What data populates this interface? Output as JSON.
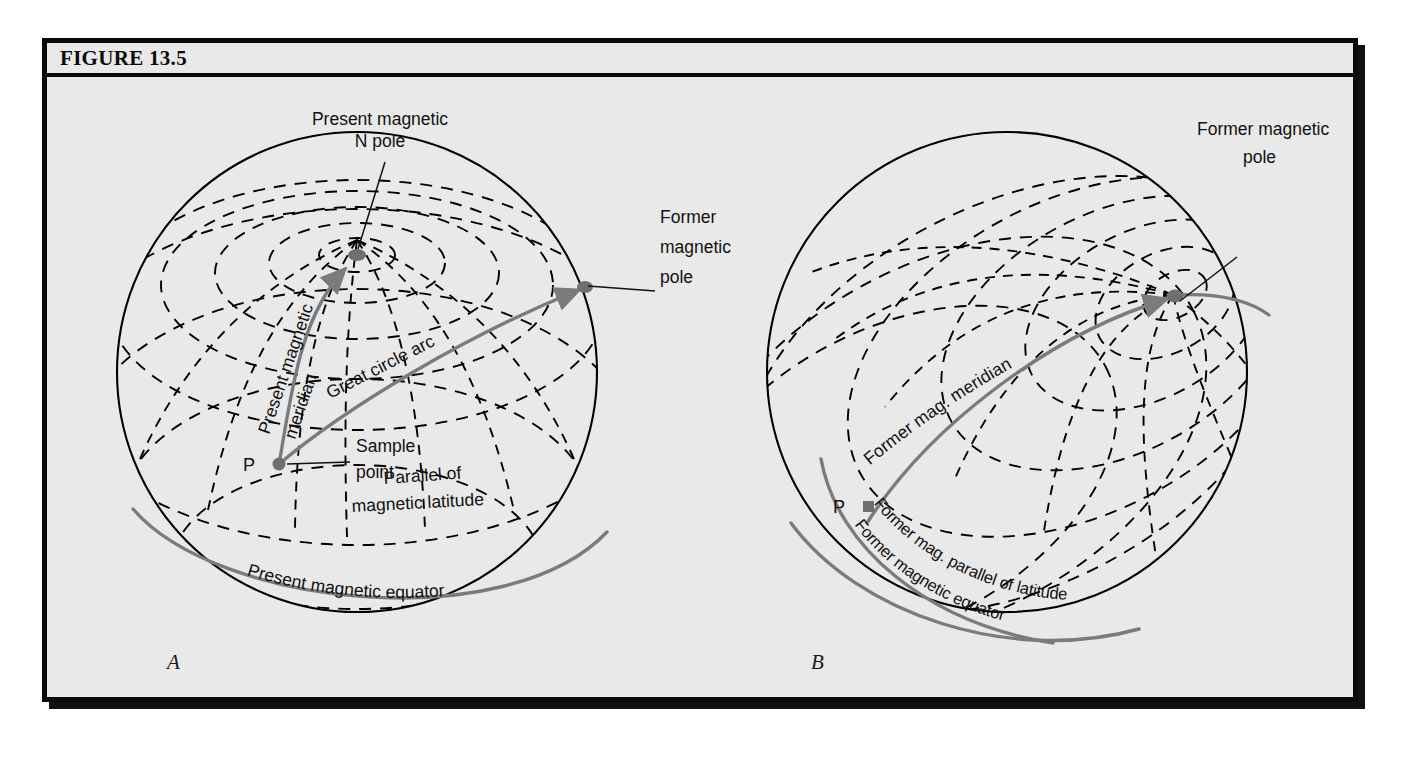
{
  "figure": {
    "caption": "FIGURE 13.5",
    "panel_a_letter": "A",
    "panel_b_letter": "B"
  },
  "colors": {
    "page_background": "#ffffff",
    "panel_background": "#e9e9e9",
    "border": "#0a0a0a",
    "highlight_curve": "#7b7b7b",
    "grid_line": "#000000",
    "marker": "#6f6f6f"
  },
  "panel_a": {
    "labels": {
      "present_pole_line1": "Present magnetic",
      "present_pole_line2": "N pole",
      "former_pole_line1": "Former",
      "former_pole_line2": "magnetic",
      "former_pole_line3": "pole",
      "present_meridian_line1": "Present magnetic",
      "present_meridian_line2": "meridian",
      "great_circle_arc": "Great circle arc",
      "sample_point_line1": "Sample",
      "sample_point_line2": "point",
      "point_p": "P",
      "parallel_line1": "Parallel of",
      "parallel_line2": "magnetic latitude",
      "equator": "Present magnetic equator"
    }
  },
  "panel_b": {
    "labels": {
      "former_pole_line1": "Former magnetic",
      "former_pole_line2": "pole",
      "former_meridian": "Former mag. meridian",
      "former_parallel": "Former mag. parallel of latitude",
      "former_equator": "Former magnetic equator",
      "point_p": "P"
    }
  }
}
